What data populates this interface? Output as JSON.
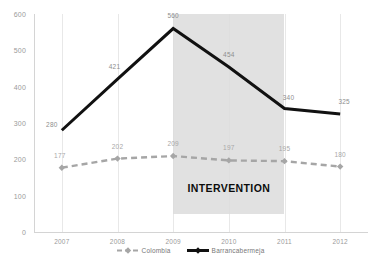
{
  "chart_data": {
    "type": "line",
    "title": "",
    "subtitle": "",
    "xlabel": "",
    "ylabel": "",
    "categories": [
      "2007",
      "2008",
      "2009",
      "2010",
      "2011",
      "2012"
    ],
    "ylim": [
      0,
      600
    ],
    "y_ticks": [
      "0",
      "100",
      "200",
      "300",
      "400",
      "500",
      "600"
    ],
    "grid": "vertical",
    "legend_position": "bottom",
    "series": [
      {
        "name": "Colombia",
        "color": "#a6a6a6",
        "style": "dashed",
        "marker": "diamond",
        "values": [
          177,
          202,
          209,
          197,
          195,
          180
        ],
        "labels": [
          "177",
          "202",
          "209",
          "197",
          "195",
          "180"
        ]
      },
      {
        "name": "Barrancabermeja",
        "color": "#111111",
        "style": "solid",
        "marker": "none",
        "values": [
          280,
          421,
          560,
          454,
          340,
          325
        ],
        "labels": [
          "280",
          "421",
          "560",
          "454",
          "340",
          "325"
        ]
      }
    ],
    "annotations": [
      {
        "text": "INTERVENTION",
        "type": "shaded-band",
        "band_start": "2009",
        "band_end": "2011",
        "band_color": "#dcdcdc"
      }
    ]
  }
}
